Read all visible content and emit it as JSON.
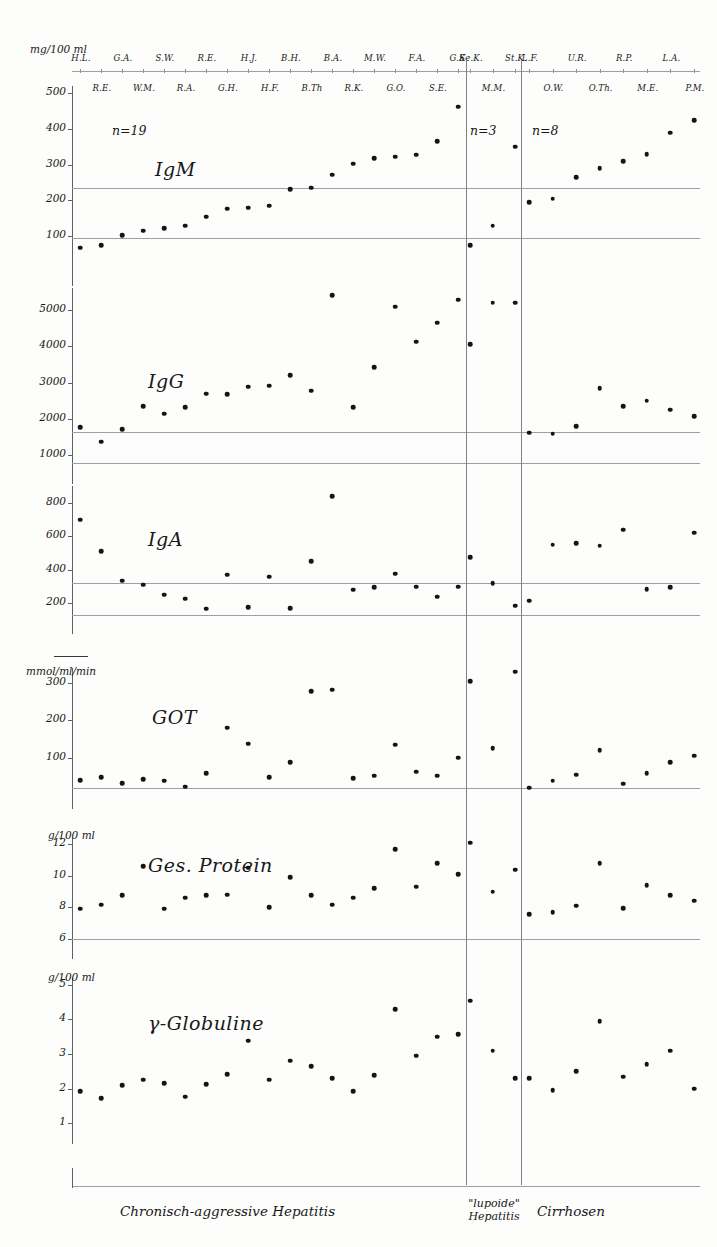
{
  "figure": {
    "panels_order": [
      "IgM",
      "IgG",
      "IgA",
      "GOT",
      "Ges. Protein",
      "γ-Globuline"
    ]
  },
  "groups": [
    {
      "id": "chronic-aggressive-hepatitis",
      "label": "Chronisch-aggressive Hepatitis",
      "n_label": "n=19",
      "labels_top": [
        "H.L.",
        "G.A.",
        "S.W.",
        "R.E.",
        "H.J.",
        "B.H.",
        "B.A.",
        "M.W.",
        "F.A.",
        "G.K."
      ],
      "labels_bottom": [
        "R.E.",
        "W.M.",
        "R.A.",
        "G.H.",
        "H.F.",
        "B.Th",
        "R.K.",
        "G.O.",
        "S.E."
      ]
    },
    {
      "id": "lupoide-hepatitis",
      "label": "\"lupoide\" Hepatitis",
      "label_line1": "\"lupoide\"",
      "label_line2": "Hepatitis",
      "n_label": "n=3",
      "labels_top": [
        "Se.K.",
        "St.K."
      ],
      "labels_bottom": [
        "M.M."
      ]
    },
    {
      "id": "cirrhosen",
      "label": "Cirrhosen",
      "n_label": "n=8",
      "labels_top": [
        "L.F.",
        "U.R.",
        "R.P.",
        "L.A."
      ],
      "labels_bottom": [
        "O.W.",
        "O.Th.",
        "M.E.",
        "P.M."
      ]
    }
  ],
  "chart_data": [
    {
      "type": "scatter",
      "title": "IgM",
      "ylabel": "mg/100 ml",
      "unit": "mg/100 ml",
      "ylim": [
        0,
        520
      ],
      "yticks": [
        100,
        200,
        300,
        400,
        500
      ],
      "reference_lines": [
        95,
        235
      ],
      "grid": false,
      "series": [
        {
          "name": "Chronisch-aggressive Hepatitis",
          "values": [
            68,
            75,
            103,
            115,
            123,
            130,
            155,
            177,
            180,
            185,
            232,
            235,
            272,
            303,
            318,
            322,
            328,
            365,
            462
          ]
        },
        {
          "name": "\"lupoide\" Hepatitis",
          "values": [
            75,
            130,
            350
          ]
        },
        {
          "name": "Cirrhosen",
          "values": [
            195,
            205,
            265,
            290,
            310,
            330,
            390,
            425
          ]
        }
      ]
    },
    {
      "type": "scatter",
      "title": "IgG",
      "ylabel": "mg/100 ml",
      "unit": "mg/100 ml",
      "ylim": [
        600,
        5600
      ],
      "yticks": [
        1000,
        2000,
        3000,
        4000,
        5000
      ],
      "reference_lines": [
        800,
        1650
      ],
      "grid": false,
      "series": [
        {
          "name": "Chronisch-aggressive Hepatitis",
          "values": [
            1780,
            1380,
            1720,
            2350,
            2150,
            2320,
            2700,
            2680,
            2890,
            2920,
            3210,
            2780,
            5400,
            2320,
            3420,
            5080,
            4120,
            4650,
            5280
          ]
        },
        {
          "name": "\"lupoide\" Hepatitis",
          "values": [
            4050,
            5200,
            5200
          ]
        },
        {
          "name": "Cirrhosen",
          "values": [
            1620,
            1600,
            1800,
            2850,
            2350,
            2500,
            2250,
            2080
          ]
        }
      ]
    },
    {
      "type": "scatter",
      "title": "IgA",
      "ylabel": "mg/100 ml",
      "unit": "mg/100 ml",
      "ylim": [
        100,
        900
      ],
      "yticks": [
        200,
        400,
        600,
        800
      ],
      "reference_lines": [
        130,
        320
      ],
      "grid": false,
      "series": [
        {
          "name": "Chronisch-aggressive Hepatitis",
          "values": [
            700,
            510,
            335,
            310,
            250,
            228,
            168,
            370,
            175,
            360,
            170,
            450,
            840,
            280,
            295,
            375,
            300,
            240,
            300
          ]
        },
        {
          "name": "\"lupoide\" Hepatitis",
          "values": [
            475,
            320,
            185
          ]
        },
        {
          "name": "Cirrhosen",
          "values": [
            215,
            550,
            560,
            545,
            640,
            285,
            295,
            620
          ]
        }
      ]
    },
    {
      "type": "scatter",
      "title": "GOT",
      "ylabel": "mmol/ml/min",
      "unit": "mmol/ml/min",
      "ylim": [
        0,
        340
      ],
      "yticks": [
        100,
        200,
        300
      ],
      "reference_lines": [
        18
      ],
      "grid": false,
      "series": [
        {
          "name": "Chronisch-aggressive Hepatitis",
          "values": [
            40,
            48,
            32,
            42,
            38,
            22,
            58,
            180,
            138,
            48,
            88,
            278,
            282,
            45,
            52,
            135,
            62,
            52,
            100
          ]
        },
        {
          "name": "\"lupoide\" Hepatitis",
          "values": [
            305,
            125,
            330
          ]
        },
        {
          "name": "Cirrhosen",
          "values": [
            20,
            38,
            55,
            120,
            30,
            58,
            88,
            105
          ]
        }
      ]
    },
    {
      "type": "scatter",
      "title": "Ges. Protein",
      "ylabel": "g/100 ml",
      "unit": "g/100 ml",
      "ylim": [
        5.6,
        12.4
      ],
      "yticks": [
        6,
        8,
        10,
        12
      ],
      "reference_lines": [
        6.0
      ],
      "grid": false,
      "series": [
        {
          "name": "Chronisch-aggressive Hepatitis",
          "values": [
            7.9,
            8.15,
            8.75,
            10.6,
            7.9,
            8.6,
            8.75,
            8.8,
            10.5,
            8.0,
            9.9,
            8.75,
            8.15,
            8.6,
            9.2,
            11.7,
            9.3,
            10.8,
            10.1
          ]
        },
        {
          "name": "\"lupoide\" Hepatitis",
          "values": [
            12.1,
            9.0,
            10.4
          ]
        },
        {
          "name": "Cirrhosen",
          "values": [
            7.55,
            7.7,
            8.1,
            10.8,
            7.95,
            9.4,
            8.75,
            8.4
          ]
        }
      ]
    },
    {
      "type": "scatter",
      "title": "γ-Globuline",
      "ylabel": "g/100 ml",
      "unit": "g/100 ml",
      "ylim": [
        0.8,
        5.2
      ],
      "yticks": [
        1,
        2,
        3,
        4,
        5
      ],
      "reference_lines": [],
      "grid": false,
      "series": [
        {
          "name": "Chronisch-aggressive Hepatitis",
          "values": [
            1.92,
            1.72,
            2.1,
            2.25,
            2.15,
            1.77,
            2.13,
            2.42,
            3.38,
            2.25,
            2.8,
            2.65,
            2.3,
            1.92,
            2.38,
            4.3,
            2.95,
            3.5,
            3.57
          ]
        },
        {
          "name": "\"lupoide\" Hepatitis",
          "values": [
            4.55,
            3.1,
            2.3
          ]
        },
        {
          "name": "Cirrhosen",
          "values": [
            2.3,
            1.95,
            2.5,
            3.95,
            2.35,
            2.7,
            3.1,
            2.0
          ]
        }
      ]
    }
  ]
}
